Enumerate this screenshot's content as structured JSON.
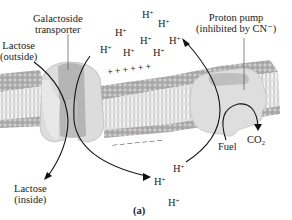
{
  "figure": {
    "caption": "(a)",
    "labels": {
      "transporter_line1": "Galactoside",
      "transporter_line2": "transporter",
      "lactose_out_line1": "Lactose",
      "lactose_out_line2": "(outside)",
      "lactose_in_line1": "Lactose",
      "lactose_in_line2": "(inside)",
      "pump_line1": "Proton pump",
      "pump_line2": "(inhibited by CN⁻)",
      "fuel": "Fuel",
      "co2": "CO₂"
    },
    "protons_outside": [
      {
        "x": 142,
        "y": 8
      },
      {
        "x": 158,
        "y": 17
      },
      {
        "x": 115,
        "y": 26
      },
      {
        "x": 140,
        "y": 34
      },
      {
        "x": 169,
        "y": 34
      },
      {
        "x": 100,
        "y": 43
      },
      {
        "x": 123,
        "y": 46
      },
      {
        "x": 153,
        "y": 46
      }
    ],
    "protons_inside": [
      {
        "x": 173,
        "y": 162
      },
      {
        "x": 154,
        "y": 175
      },
      {
        "x": 168,
        "y": 196
      }
    ],
    "proton_text": "H",
    "proton_charge": "+",
    "membrane_charges": {
      "outside": "+ + + + + +",
      "inside": "– – – – – – –"
    },
    "colors": {
      "membrane_head": "#b5b5b5",
      "membrane_tail": "#9a9a9a",
      "protein": "#d9d9d9",
      "protein_dark": "#a8a8a8",
      "arrow": "#111111"
    }
  }
}
